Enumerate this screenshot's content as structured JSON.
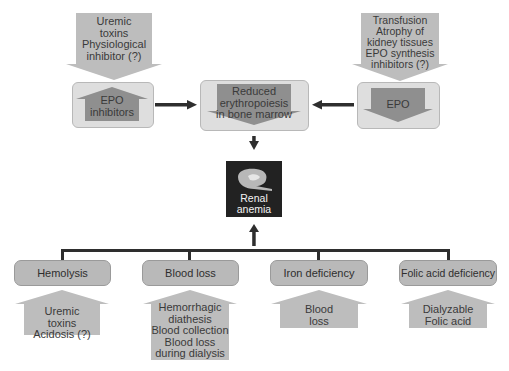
{
  "top_left": {
    "input_arrow_lines": [
      "Uremic",
      "toxins",
      "Physiological",
      "inhibitor (?)"
    ],
    "box_label_lines": [
      "EPO",
      "inhibitors"
    ]
  },
  "top_center": {
    "box_label_lines": [
      "Reduced",
      "erythropoiesis",
      "in bone marrow"
    ]
  },
  "top_right": {
    "input_arrow_lines": [
      "Transfusion",
      "Atrophy of",
      "kidney tissues",
      "EPO synthesis",
      "inhibitors (?)"
    ],
    "box_label_lines": [
      "EPO"
    ]
  },
  "center": {
    "label_lines": [
      "Renal",
      "anemia"
    ],
    "icon": "kidney-icon"
  },
  "causes": [
    {
      "label": "Hemolysis",
      "factors": [
        "Uremic",
        "toxins",
        "Acidosis (?)"
      ]
    },
    {
      "label": "Blood loss",
      "factors": [
        "Hemorrhagic",
        "diathesis",
        "Blood collection",
        "Blood loss",
        "during dialysis"
      ]
    },
    {
      "label": "Iron deficiency",
      "factors": [
        "Blood",
        "loss"
      ]
    },
    {
      "label": "Folic acid deficiency",
      "factors": [
        "Dialyzable",
        "Folic acid"
      ]
    }
  ],
  "colors": {
    "arrow_light": "#bdbdbd",
    "arrow_dark": "#8f8f8f",
    "box_bg": "#dedede",
    "pill_bg": "#b9b9b9",
    "center_bg": "#222222",
    "connector": "#2e2e2e"
  }
}
